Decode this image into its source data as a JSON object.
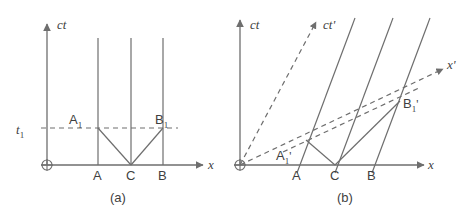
{
  "figure": {
    "panels": [
      {
        "id": "a",
        "caption": "(a)",
        "axes": {
          "vertical_label": "ct",
          "horizontal_label": "x",
          "origin_marker": "circled-plus"
        },
        "time_marker": {
          "label": "t",
          "sub": "1"
        },
        "events": [
          {
            "name": "A",
            "label": "A"
          },
          {
            "name": "C",
            "label": "C"
          },
          {
            "name": "B",
            "label": "B"
          }
        ],
        "reception_events": [
          {
            "name": "A1",
            "label": "A",
            "sub": "1"
          },
          {
            "name": "B1",
            "label": "B",
            "sub": "1"
          }
        ]
      },
      {
        "id": "b",
        "caption": "(b)",
        "axes": {
          "vertical_label": "ct",
          "horizontal_label": "x",
          "primed_vertical_label": "ct'",
          "primed_horizontal_label": "x'",
          "origin_marker": "circled-plus"
        },
        "events": [
          {
            "name": "A",
            "label": "A"
          },
          {
            "name": "C",
            "label": "C"
          },
          {
            "name": "B",
            "label": "B"
          }
        ],
        "reception_events": [
          {
            "name": "A1prime",
            "label": "A",
            "sub": "1",
            "prime": "'"
          },
          {
            "name": "B1prime",
            "label": "B",
            "sub": "1",
            "prime": "'"
          }
        ]
      }
    ],
    "colors": {
      "line": "#6e6e6e",
      "text": "#3f3f3f",
      "background": "#ffffff"
    }
  }
}
